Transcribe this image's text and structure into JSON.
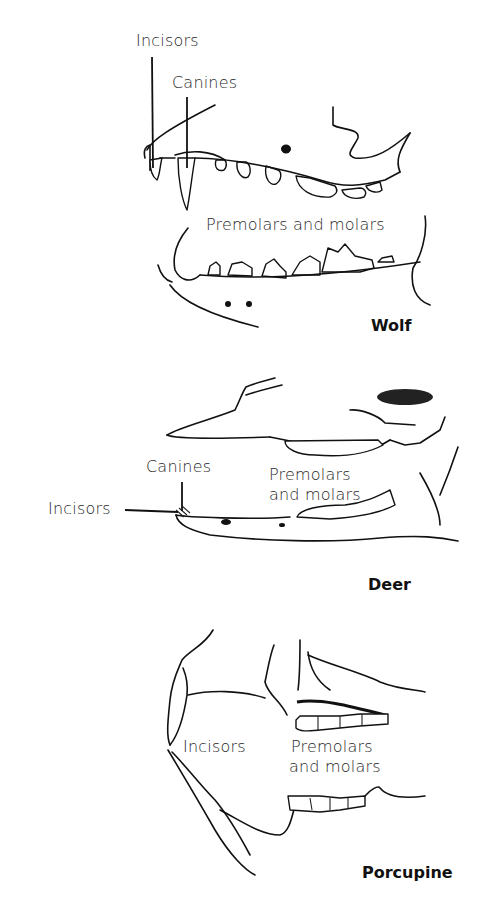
{
  "figure": {
    "panels": [
      {
        "animal": "Wolf",
        "labels": {
          "incisors": "Incisors",
          "canines": "Canines",
          "premolars_molars": "Premolars and molars"
        }
      },
      {
        "animal": "Deer",
        "labels": {
          "incisors": "Incisors",
          "canines": "Canines",
          "premolars_line1": "Premolars",
          "premolars_line2": "and molars"
        }
      },
      {
        "animal": "Porcupine",
        "labels": {
          "incisors": "Incisors",
          "premolars_line1": "Premolars",
          "premolars_line2": "and molars"
        }
      }
    ]
  }
}
